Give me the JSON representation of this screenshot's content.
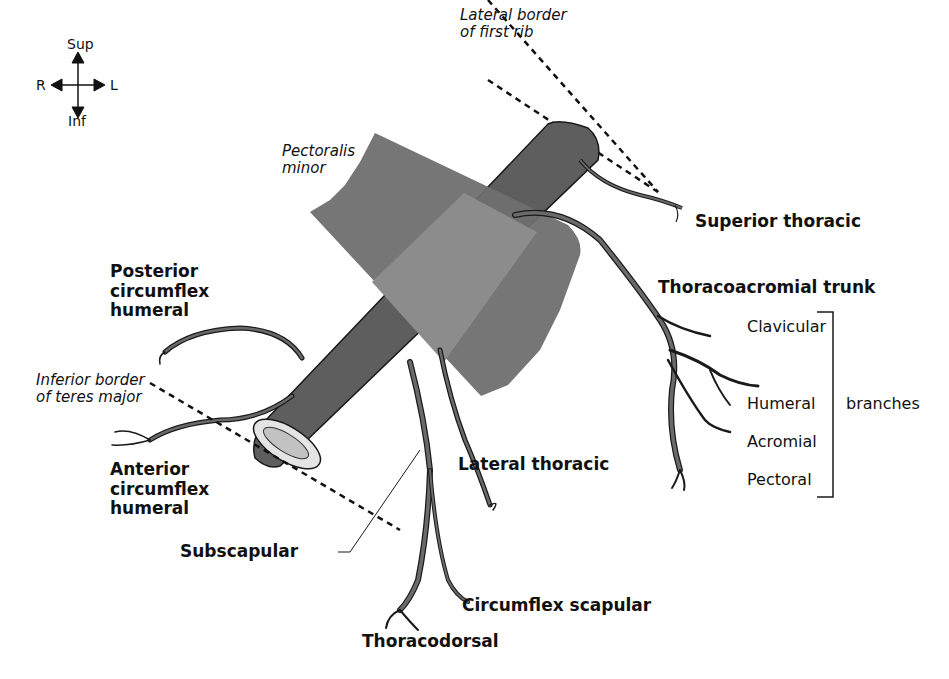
{
  "orientation": {
    "sup": "Sup",
    "inf": "Inf",
    "right": "R",
    "left": "L"
  },
  "landmarks": {
    "first_rib": [
      "Lateral border",
      "of first rib"
    ],
    "pectoralis_minor": [
      "Pectoralis",
      "minor"
    ],
    "teres_major": [
      "Inferior border",
      "of teres major"
    ]
  },
  "branches": {
    "superior_thoracic": "Superior thoracic",
    "thoracoacromial_trunk": "Thoracoacromial trunk",
    "posterior_circumflex_humeral": [
      "Posterior",
      "circumflex",
      "humeral"
    ],
    "anterior_circumflex_humeral": [
      "Anterior",
      "circumflex",
      "humeral"
    ],
    "lateral_thoracic": "Lateral thoracic",
    "subscapular": "Subscapular",
    "circumflex_scapular": "Circumflex scapular",
    "thoracodorsal": "Thoracodorsal"
  },
  "thoracoacromial_branches": {
    "items": [
      "Clavicular",
      "Humeral",
      "Acromial",
      "Pectoral"
    ],
    "group_label": "branches"
  },
  "colors": {
    "artery": "#5e5e5e",
    "muscle": "#6f6f6f",
    "muscle_overlap": "#8a8a8a",
    "lumen": "#c8c8c8",
    "outline": "#1a1a1a"
  }
}
